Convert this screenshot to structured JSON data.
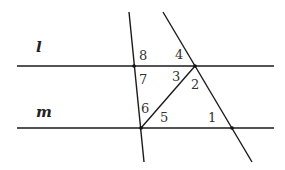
{
  "diagram": {
    "type": "parallel lines cut by transversals",
    "line_labels": {
      "l": "l",
      "m": "m"
    },
    "angle_labels": [
      "1",
      "2",
      "3",
      "4",
      "5",
      "6",
      "7",
      "8"
    ],
    "points": {
      "left_on_l": [
        134,
        66
      ],
      "right_on_l": [
        195,
        66
      ],
      "left_on_m": [
        141,
        128
      ],
      "right_on_m": [
        232,
        128
      ]
    },
    "colors": {
      "stroke": "#1a1a1a",
      "label": "#333333",
      "background": "#ffffff"
    }
  }
}
